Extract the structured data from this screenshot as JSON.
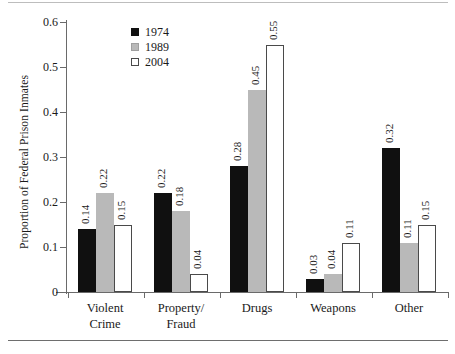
{
  "chart_data": {
    "type": "bar",
    "title": "",
    "subtitle": "",
    "xlabel": "",
    "ylabel": "Proportion of Federal Prison Inmates",
    "ylim": [
      0,
      0.6
    ],
    "ytick_labels": [
      "0",
      "0.1",
      "0.2",
      "0.3",
      "0.4",
      "0.5",
      "0.6"
    ],
    "ytick_values": [
      0,
      0.1,
      0.2,
      0.3,
      0.4,
      0.5,
      0.6
    ],
    "grid": false,
    "legend_position": "upper-left-inside",
    "categories": [
      "Violent Crime",
      "Property/ Fraud",
      "Drugs",
      "Weapons",
      "Other"
    ],
    "category_lines": [
      [
        "Violent",
        "Crime"
      ],
      [
        "Property/",
        "Fraud"
      ],
      [
        "Drugs",
        ""
      ],
      [
        "Weapons",
        ""
      ],
      [
        "Other",
        ""
      ]
    ],
    "series": [
      {
        "name": "1974",
        "color": "#101010",
        "values": [
          0.14,
          0.22,
          0.28,
          0.03,
          0.32
        ],
        "labels": [
          "0.14",
          "0.22",
          "0.28",
          "0.03",
          "0.32"
        ]
      },
      {
        "name": "1989",
        "color": "#b9b9b9",
        "values": [
          0.22,
          0.18,
          0.45,
          0.04,
          0.11
        ],
        "labels": [
          "0.22",
          "0.18",
          "0.45",
          "0.04",
          "0.11"
        ]
      },
      {
        "name": "2004",
        "color": "#ffffff",
        "values": [
          0.15,
          0.04,
          0.55,
          0.11,
          0.15
        ],
        "labels": [
          "0.15",
          "0.04",
          "0.55",
          "0.11",
          "0.15"
        ]
      }
    ]
  }
}
